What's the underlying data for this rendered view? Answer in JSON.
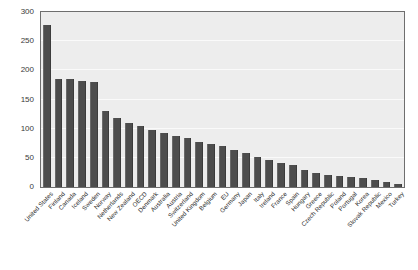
{
  "chart_data": {
    "type": "bar",
    "title": "",
    "xlabel": "",
    "ylabel": "",
    "ylim": [
      0,
      300
    ],
    "yticks": [
      0,
      50,
      100,
      150,
      200,
      250,
      300
    ],
    "grid": true,
    "legend": "none",
    "orientation": "vertical",
    "bar_color": "#4d4d4d",
    "plot_background": "#ededed",
    "categories": [
      "United States",
      "Finland",
      "Canada",
      "Iceland",
      "Sweden",
      "Norway",
      "Netherlands",
      "New Zealand",
      "OECD",
      "Denmark",
      "Australia",
      "Austria",
      "Switzerland",
      "United Kingdom",
      "Belgium",
      "EU",
      "Germany",
      "Japan",
      "Italy",
      "Ireland",
      "France",
      "Spain",
      "Hungary",
      "Greece",
      "Czech Republic",
      "Poland",
      "Portugal",
      "Korea",
      "Slovak Republic",
      "Mexico",
      "Turkey"
    ],
    "values": [
      278,
      186,
      185,
      182,
      180,
      130,
      118,
      110,
      104,
      98,
      92,
      88,
      84,
      78,
      74,
      70,
      64,
      58,
      52,
      46,
      42,
      38,
      30,
      24,
      20,
      19,
      18,
      16,
      12,
      8,
      5
    ]
  }
}
